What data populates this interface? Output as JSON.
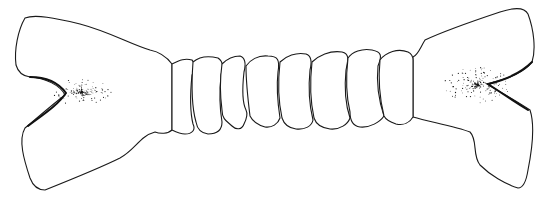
{
  "figure": {
    "width": 555,
    "height": 202,
    "colors": {
      "line": "#1a1a1a",
      "background": "#ffffff"
    },
    "left_end": {
      "path": "M 25 18 C 35 14, 55 18, 80 24 C 110 32, 130 44, 150 50 C 160 52, 166 56, 172 64 L 172 130 C 168 134, 160 134, 155 132 C 140 136, 135 150, 120 158 C 100 168, 70 180, 45 190 C 38 190, 33 186, 30 178 C 24 160, 18 140, 25 128 C 35 120, 48 108, 65 95 C 60 85, 45 78, 30 77 C 22 76, 18 72, 16 65 C 14 50, 18 30, 25 18 Z",
      "notch_edge": "M 30 77 C 45 77, 58 82, 66 93 C 58 105, 44 114, 28 126"
    },
    "right_end": {
      "path": "M 413 57 C 418 55, 420 48, 425 40 C 440 33, 470 22, 500 12 C 515 7, 525 8, 528 14 C 534 30, 536 50, 532 62 C 525 72, 510 78, 487 84 C 500 92, 515 100, 530 110 C 535 125, 532 150, 528 170 C 526 183, 522 188, 518 188 C 505 184, 490 175, 480 165 C 472 155, 478 140, 470 132 C 455 126, 430 122, 413 117 Z",
      "notch_edge": "M 532 62 C 520 74, 505 80, 488 84 C 500 92, 512 100, 528 110"
    },
    "segments": [
      {
        "path": "M 172 64 C 180 60, 185 58, 192 60 C 196 64, 195 70, 192 75 C 190 95, 190 112, 193 124 C 196 130, 192 134, 185 134 C 180 134, 176 132, 172 130 Z"
      },
      {
        "path": "M 193 62 C 200 56, 210 56, 218 58 C 224 62, 223 68, 221 75 C 219 95, 220 110, 222 122 C 222 130, 217 134, 208 134 C 200 133, 197 128, 196 122 C 192 108, 191 90, 193 62 Z"
      },
      {
        "path": "M 222 64 C 226 60, 232 56, 240 56 C 246 58, 246 64, 244 72 C 242 90, 243 104, 246 110 C 248 114, 246 120, 244 124 C 242 130, 236 130, 232 126 C 228 122, 222 120, 222 110 C 220 95, 220 78, 222 64 Z"
      },
      {
        "path": "M 246 66 C 250 60, 258 55, 268 56 C 278 56, 280 60, 278 72 C 276 90, 278 105, 280 118 C 278 124, 272 128, 265 127 C 258 125, 253 122, 250 116 C 248 100, 246 82, 246 66 Z"
      },
      {
        "path": "M 280 62 C 286 56, 296 52, 306 54 C 312 56, 312 62, 310 70 C 308 90, 310 108, 313 120 C 312 126, 305 130, 296 129 C 288 128, 284 124, 282 118 C 278 100, 278 80, 280 62 Z"
      },
      {
        "path": "M 312 62 C 318 56, 330 50, 342 52 C 350 54, 348 60, 346 70 C 344 90, 346 106, 350 118 C 348 124, 340 130, 330 129 C 322 128, 316 124, 314 118 C 310 100, 310 80, 312 62 Z"
      },
      {
        "path": "M 348 58 C 352 52, 362 48, 372 50 C 382 52, 382 56, 378 66 C 376 86, 380 104, 384 116 C 380 122, 370 128, 360 127 C 352 126, 350 120, 350 112 C 346 95, 346 75, 348 58 Z"
      },
      {
        "path": "M 380 60 C 386 52, 398 48, 408 52 C 412 54, 413 56, 413 60 L 413 117 C 410 122, 404 126, 396 124 C 390 122, 386 120, 384 116 C 380 100, 378 80, 380 60 Z"
      }
    ],
    "stipple_regions": [
      {
        "cx": 82,
        "cy": 92,
        "rx": 30,
        "ry": 14,
        "density": 160,
        "seed": 7
      },
      {
        "cx": 478,
        "cy": 85,
        "rx": 34,
        "ry": 18,
        "density": 200,
        "seed": 13
      }
    ]
  }
}
